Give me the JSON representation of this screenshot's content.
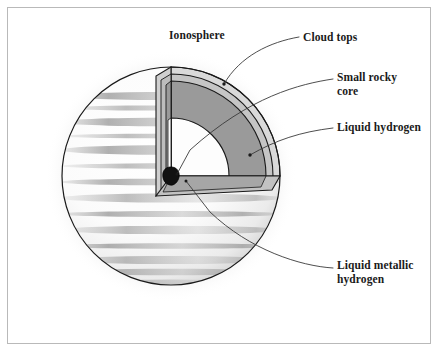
{
  "figure": {
    "frame_color": "#b9b9b9",
    "background": "#ffffff"
  },
  "labels": {
    "ionosphere": "Ionosphere",
    "cloud_tops": "Cloud tops",
    "small_rocky_core": "Small rocky\ncore",
    "liquid_hydrogen": "Liquid hydrogen",
    "liquid_metallic_hydrogen": "Liquid metallic\nhydrogen"
  },
  "layers": [
    {
      "name": "ionosphere",
      "label": "Ionosphere",
      "color": "#d9d9d9",
      "order": 0
    },
    {
      "name": "cloud-tops",
      "label": "Cloud tops",
      "color": "#c9c9c9",
      "order": 1
    },
    {
      "name": "liquid-hydrogen",
      "label": "Liquid hydrogen",
      "color": "#9a9a9a",
      "order": 2
    },
    {
      "name": "liquid-metallic-hydrogen",
      "label": "Liquid metallic hydrogen",
      "color": "#fdfdfd",
      "order": 3
    },
    {
      "name": "small-rocky-core",
      "label": "Small rocky core",
      "color": "#111111",
      "order": 4
    }
  ],
  "colors": {
    "outline": "#1a1a1a",
    "leader_line": "#3a3a3a",
    "planet_body": "#fbfbfb",
    "band_shading": "#9d9d9d",
    "glow": "#d0d0d0"
  },
  "geometry": {
    "sphere_center_x": 171,
    "sphere_center_y": 176,
    "sphere_radius": 109,
    "core_radius": 9
  }
}
